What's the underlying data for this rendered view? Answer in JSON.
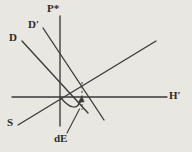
{
  "figure": {
    "background_color": "#e9e7e1",
    "line_color": "#3a3a3a",
    "label_color": "#2b2b2b",
    "labels": {
      "p_star": "P*",
      "d_prime": "D′",
      "d": "D",
      "h_prime": "H′",
      "s": "S",
      "de": "dE"
    },
    "geometry": {
      "origin": {
        "x": 60,
        "y": 97
      },
      "lines": [
        {
          "name": "p-star-vertical-axis",
          "label": "P*",
          "x1": 60,
          "y1": 16,
          "x2": 60,
          "y2": 126,
          "style": "solid"
        },
        {
          "name": "h-prime-horizontal-axis",
          "label": "H′",
          "x1": 12,
          "y1": 97,
          "x2": 167,
          "y2": 97,
          "style": "solid"
        },
        {
          "name": "s-rising-line",
          "label": "S",
          "x1": 18,
          "y1": 125,
          "x2": 156,
          "y2": 41,
          "style": "solid"
        },
        {
          "name": "d-falling-line",
          "label": "D",
          "x1": 22,
          "y1": 41,
          "x2": 88,
          "y2": 113,
          "style": "solid"
        },
        {
          "name": "d-prime-falling-line",
          "label": "D′",
          "x1": 43,
          "y1": 28,
          "x2": 104,
          "y2": 120,
          "style": "solid"
        }
      ],
      "dashed_segment": {
        "name": "de-dashed-drop-line",
        "x1": 82,
        "y1": 82,
        "x2": 82,
        "y2": 110,
        "style": "dashed"
      },
      "arc": {
        "name": "de-curved-arrow",
        "from": {
          "x": 60,
          "y": 97
        },
        "to": {
          "x": 81,
          "y": 96
        },
        "arrowhead_at": {
          "x": 81,
          "y": 96
        },
        "direction": "counterclockwise"
      },
      "leader": {
        "name": "de-label-leader",
        "x1": 66,
        "y1": 132,
        "x2": 79,
        "y2": 110
      }
    }
  }
}
